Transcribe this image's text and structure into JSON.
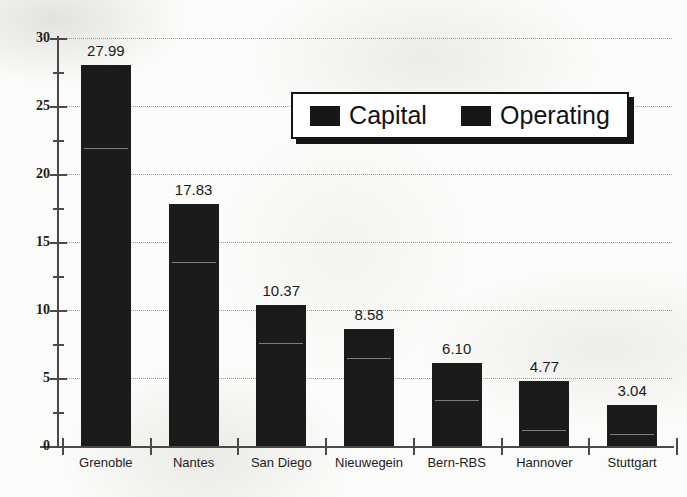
{
  "chart_data": {
    "type": "bar",
    "subtype": "stacked-bar",
    "title": "",
    "xlabel": "",
    "ylabel": "",
    "ylim": [
      0,
      30
    ],
    "ytick_step": 5,
    "yminor_step": 2.5,
    "grid": true,
    "grid_style": "dotted",
    "legend_position": "upper-center",
    "categories": [
      "Grenoble",
      "Nantes",
      "San Diego",
      "Nieuwegein",
      "Bern-RBS",
      "Hannover",
      "Stuttgart"
    ],
    "totals": [
      27.99,
      17.83,
      10.37,
      8.58,
      6.1,
      4.77,
      3.04
    ],
    "data_labels": [
      "27.99",
      "17.83",
      "10.37",
      "8.58",
      "6.10",
      "4.77",
      "3.04"
    ],
    "series": [
      {
        "name": "Capital",
        "values": [
          21.9,
          13.5,
          7.6,
          6.5,
          3.4,
          1.2,
          0.9
        ]
      },
      {
        "name": "Operating",
        "values": [
          6.09,
          4.33,
          2.77,
          2.08,
          2.7,
          3.57,
          2.14
        ]
      }
    ],
    "ytick_labels": [
      "0",
      "5",
      "10",
      "15",
      "20",
      "25",
      "30"
    ],
    "ytick_values": [
      0,
      5,
      10,
      15,
      20,
      25,
      30
    ]
  },
  "legend": {
    "entries": [
      {
        "label": "Capital",
        "color": "#171717"
      },
      {
        "label": "Operating",
        "color": "#171717"
      }
    ]
  },
  "colors": {
    "bar": "#1b1b1b",
    "axis": "#4a4a4a",
    "grid": "#8d8d8d",
    "text": "#1c1c1c",
    "background": "#fbfbf9"
  }
}
